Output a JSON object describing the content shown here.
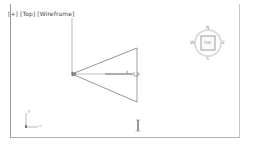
{
  "viewport": {
    "label": "[+] [Top] [Wireframe]",
    "view": "Top",
    "shading": "Wireframe"
  },
  "viewcube": {
    "face": "TOP",
    "north": "N",
    "south": "S",
    "east": "E",
    "west": "W"
  },
  "axis_tripod": {
    "x_label": "x",
    "y_label": "y"
  },
  "gizmo": {
    "axis_label": "x"
  },
  "bottom_label": "camera"
}
